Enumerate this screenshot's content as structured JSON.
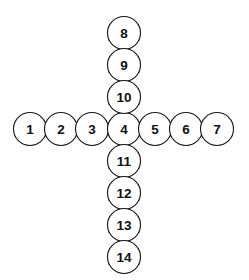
{
  "diagram": {
    "shape": "cross",
    "background_color": "#ffffff",
    "circle_fill": "#ffffff",
    "circle_stroke": "#1a1a1a",
    "label_color": "#111111",
    "circle_diameter": 33,
    "horizontal_spacing": 31,
    "vertical_spacing": 32
  },
  "chart_data": {
    "type": "diagram",
    "xlabel": "",
    "ylabel": "",
    "nodes": [
      {
        "label": "1",
        "cx": 30,
        "cy": 129,
        "arm": "left"
      },
      {
        "label": "2",
        "cx": 61,
        "cy": 129,
        "arm": "left"
      },
      {
        "label": "3",
        "cx": 92,
        "cy": 129,
        "arm": "left"
      },
      {
        "label": "4",
        "cx": 124,
        "cy": 129,
        "arm": "center"
      },
      {
        "label": "5",
        "cx": 155,
        "cy": 129,
        "arm": "right"
      },
      {
        "label": "6",
        "cx": 186,
        "cy": 129,
        "arm": "right"
      },
      {
        "label": "7",
        "cx": 217,
        "cy": 129,
        "arm": "right"
      },
      {
        "label": "8",
        "cx": 124,
        "cy": 33,
        "arm": "top"
      },
      {
        "label": "9",
        "cx": 124,
        "cy": 65,
        "arm": "top"
      },
      {
        "label": "10",
        "cx": 124,
        "cy": 97,
        "arm": "top"
      },
      {
        "label": "11",
        "cx": 124,
        "cy": 161,
        "arm": "bottom"
      },
      {
        "label": "12",
        "cx": 124,
        "cy": 193,
        "arm": "bottom"
      },
      {
        "label": "13",
        "cx": 124,
        "cy": 225,
        "arm": "bottom"
      },
      {
        "label": "14",
        "cx": 124,
        "cy": 257,
        "arm": "bottom"
      }
    ],
    "row_labels": [
      "1",
      "2",
      "3",
      "4",
      "5",
      "6",
      "7"
    ],
    "column_labels": [
      "8",
      "9",
      "10",
      "4",
      "11",
      "12",
      "13",
      "14"
    ]
  }
}
